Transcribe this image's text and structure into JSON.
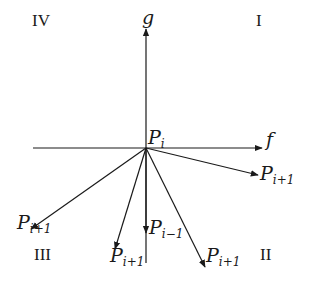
{
  "diagram": {
    "type": "vector-direction-diagram",
    "origin_label": {
      "base": "P",
      "sub": "i"
    },
    "axes": {
      "horizontal": {
        "label": "f"
      },
      "vertical": {
        "label": "g"
      }
    },
    "quadrants": {
      "I": "I",
      "II": "II",
      "III": "III",
      "IV": "IV"
    },
    "vectors": [
      {
        "id": "right",
        "base": "P",
        "sub": "i+1"
      },
      {
        "id": "lower-left",
        "base": "P",
        "sub": "i+1"
      },
      {
        "id": "down-left",
        "base": "P",
        "sub": "i+1"
      },
      {
        "id": "down",
        "base": "P",
        "sub": "i−1"
      },
      {
        "id": "down-right",
        "base": "P",
        "sub": "i+1"
      }
    ],
    "colors": {
      "stroke": "#1a1a1a",
      "background": "#ffffff"
    }
  }
}
